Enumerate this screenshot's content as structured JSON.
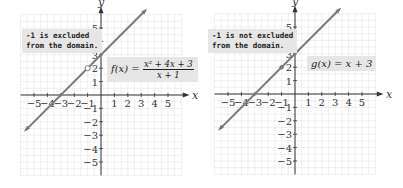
{
  "chart_data": [
    {
      "type": "line",
      "title": "",
      "xlabel": "x",
      "ylabel": "y",
      "xlim": [
        -6,
        6
      ],
      "ylim": [
        -6,
        6
      ],
      "grid": true,
      "x_ticks": [
        -5,
        -4,
        -3,
        -2,
        -1,
        1,
        2,
        3,
        4,
        5
      ],
      "y_ticks": [
        -5,
        -4,
        -3,
        -2,
        -1,
        1,
        2,
        3,
        4,
        5
      ],
      "series": [
        {
          "name": "f(x) = (x^2 + 4x + 3)/(x + 1)",
          "x": [
            -5,
            3
          ],
          "y": [
            -2,
            6
          ],
          "hole": [
            -1,
            2
          ]
        }
      ],
      "annotations": [
        "-1 is excluded\nfrom the domain."
      ],
      "label_numerator": "x² + 4x + 3",
      "label_denominator": "x + 1",
      "label_lhs": "f(x) ="
    },
    {
      "type": "line",
      "title": "",
      "xlabel": "x",
      "ylabel": "y",
      "xlim": [
        -6,
        6
      ],
      "ylim": [
        -6,
        6
      ],
      "grid": true,
      "x_ticks": [
        -5,
        -4,
        -3,
        -2,
        -1,
        1,
        2,
        3,
        4,
        5
      ],
      "y_ticks": [
        -5,
        -4,
        -3,
        -2,
        -1,
        1,
        2,
        3,
        4,
        5
      ],
      "series": [
        {
          "name": "g(x) = x + 3",
          "x": [
            -5,
            3
          ],
          "y": [
            -2,
            6
          ],
          "point": [
            -1,
            2
          ]
        }
      ],
      "annotations": [
        "-1 is not excluded\nfrom the domain."
      ],
      "label": "g(x) = x + 3"
    }
  ],
  "colors": {
    "line": "#7a7a7a",
    "grid": "#cfcfcf",
    "box": "#e6e6e6"
  }
}
